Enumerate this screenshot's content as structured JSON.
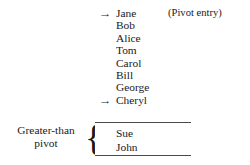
{
  "figure": {
    "background_color": "#ffffff",
    "text_color": "#1a1a1a",
    "rule_color": "#4a4a4a",
    "arrow_glyph": "→",
    "brace_glyph": "{",
    "pivot_annotation": "(Pivot entry)",
    "partition_label": {
      "line1": "Greater-than",
      "line2": "pivot"
    },
    "entries": [
      {
        "name": "Jane",
        "arrow": true,
        "annotation": "(Pivot entry)"
      },
      {
        "name": "Bob",
        "arrow": false,
        "annotation": ""
      },
      {
        "name": "Alice",
        "arrow": false,
        "annotation": ""
      },
      {
        "name": "Tom",
        "arrow": false,
        "annotation": ""
      },
      {
        "name": "Carol",
        "arrow": false,
        "annotation": ""
      },
      {
        "name": "Bill",
        "arrow": false,
        "annotation": ""
      },
      {
        "name": "George",
        "arrow": false,
        "annotation": ""
      },
      {
        "name": "Cheryl",
        "arrow": true,
        "annotation": ""
      }
    ],
    "greater_than_entries": [
      {
        "name": "Sue"
      },
      {
        "name": "John"
      }
    ]
  }
}
